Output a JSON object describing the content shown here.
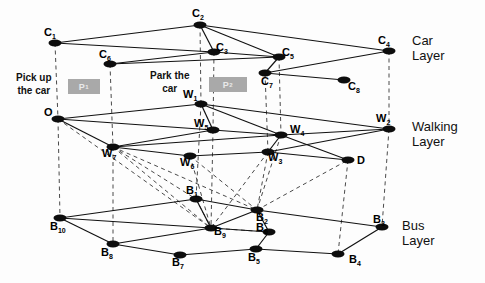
{
  "layers": [
    {
      "id": "car",
      "label_line1": "Car",
      "label_line2": "Layer",
      "x": 412,
      "y": 34
    },
    {
      "id": "walking",
      "label_line1": "Walking",
      "label_line2": "Layer",
      "x": 412,
      "y": 120
    },
    {
      "id": "bus",
      "label_line1": "Bus",
      "label_line2": "Layer",
      "x": 402,
      "y": 219
    }
  ],
  "actions": [
    {
      "id": "pickup",
      "line1": "Pick up",
      "line2": "the car",
      "x": 16,
      "y": 72,
      "box_label": "P",
      "box_sub": "1",
      "box_x": 68,
      "box_y": 79,
      "box_w": 32,
      "box_h": 15
    },
    {
      "id": "park",
      "line1": "Park the",
      "line2": "car",
      "x": 150,
      "y": 70,
      "box_label": "P",
      "box_sub": "2",
      "box_x": 209,
      "box_y": 77,
      "box_w": 38,
      "box_h": 15
    }
  ],
  "nodes": [
    {
      "id": "C1",
      "label": "C",
      "sub": "1",
      "x": 55,
      "y": 43,
      "lx": 44,
      "ly": 27
    },
    {
      "id": "C2",
      "label": "C",
      "sub": "2",
      "x": 200,
      "y": 25,
      "lx": 192,
      "ly": 8
    },
    {
      "id": "C3",
      "label": "C",
      "sub": "3",
      "x": 214,
      "y": 52,
      "lx": 216,
      "ly": 42
    },
    {
      "id": "C4",
      "label": "C",
      "sub": "4",
      "x": 389,
      "y": 51,
      "lx": 378,
      "ly": 35
    },
    {
      "id": "C5",
      "label": "C",
      "sub": "5",
      "x": 279,
      "y": 57,
      "lx": 282,
      "ly": 47
    },
    {
      "id": "C6",
      "label": "C",
      "sub": "6",
      "x": 110,
      "y": 64,
      "lx": 99,
      "ly": 49
    },
    {
      "id": "C7",
      "label": "C",
      "sub": "7",
      "x": 265,
      "y": 73,
      "lx": 261,
      "ly": 76
    },
    {
      "id": "C8",
      "label": "C",
      "sub": "8",
      "x": 344,
      "y": 80,
      "lx": 348,
      "ly": 81
    },
    {
      "id": "O",
      "label": "O",
      "sub": "",
      "x": 58,
      "y": 119,
      "lx": 44,
      "ly": 107
    },
    {
      "id": "W1",
      "label": "W",
      "sub": "1",
      "x": 201,
      "y": 104,
      "lx": 183,
      "ly": 89
    },
    {
      "id": "W2",
      "label": "W",
      "sub": "2",
      "x": 389,
      "y": 129,
      "lx": 376,
      "ly": 113
    },
    {
      "id": "W3",
      "label": "W",
      "sub": "3",
      "x": 268,
      "y": 152,
      "lx": 268,
      "ly": 152
    },
    {
      "id": "W4",
      "label": "W",
      "sub": "4",
      "x": 281,
      "y": 135,
      "lx": 290,
      "ly": 124
    },
    {
      "id": "W5",
      "label": "W",
      "sub": "5",
      "x": 213,
      "y": 130,
      "lx": 194,
      "ly": 118
    },
    {
      "id": "W6",
      "label": "W",
      "sub": "6",
      "x": 190,
      "y": 156,
      "lx": 180,
      "ly": 157
    },
    {
      "id": "W7",
      "label": "W",
      "sub": "7",
      "x": 113,
      "y": 147,
      "lx": 102,
      "ly": 148
    },
    {
      "id": "D",
      "label": "D",
      "sub": "",
      "x": 348,
      "y": 160,
      "lx": 357,
      "ly": 155
    },
    {
      "id": "B1",
      "label": "B",
      "sub": "1",
      "x": 196,
      "y": 199,
      "lx": 186,
      "ly": 185
    },
    {
      "id": "B2",
      "label": "B",
      "sub": "2",
      "x": 257,
      "y": 210,
      "lx": 256,
      "ly": 212
    },
    {
      "id": "B3",
      "label": "B",
      "sub": "3",
      "x": 382,
      "y": 227,
      "lx": 373,
      "ly": 214
    },
    {
      "id": "B4",
      "label": "B",
      "sub": "4",
      "x": 338,
      "y": 254,
      "lx": 349,
      "ly": 254
    },
    {
      "id": "B5",
      "label": "B",
      "sub": "5",
      "x": 256,
      "y": 249,
      "lx": 248,
      "ly": 252
    },
    {
      "id": "B6",
      "label": "B",
      "sub": "6",
      "x": 269,
      "y": 232,
      "lx": 256,
      "ly": 222
    },
    {
      "id": "B7",
      "label": "B",
      "sub": "7",
      "x": 180,
      "y": 255,
      "lx": 172,
      "ly": 257
    },
    {
      "id": "B8",
      "label": "B",
      "sub": "8",
      "x": 113,
      "y": 244,
      "lx": 101,
      "ly": 247
    },
    {
      "id": "B9",
      "label": "B",
      "sub": "9",
      "x": 211,
      "y": 228,
      "lx": 214,
      "ly": 226
    },
    {
      "id": "B10",
      "label": "B",
      "sub": "10",
      "x": 60,
      "y": 218,
      "lx": 50,
      "ly": 221
    }
  ],
  "solid_edges": [
    [
      "C1",
      "C2"
    ],
    [
      "C1",
      "C3"
    ],
    [
      "C2",
      "C3"
    ],
    [
      "C2",
      "C4"
    ],
    [
      "C2",
      "C5"
    ],
    [
      "C3",
      "C5"
    ],
    [
      "C6",
      "C3"
    ],
    [
      "C6",
      "C5"
    ],
    [
      "C5",
      "C7"
    ],
    [
      "C7",
      "C4"
    ],
    [
      "C7",
      "C8"
    ],
    [
      "O",
      "W1"
    ],
    [
      "O",
      "W5"
    ],
    [
      "O",
      "W7"
    ],
    [
      "W1",
      "W5"
    ],
    [
      "W1",
      "W4"
    ],
    [
      "W1",
      "W2"
    ],
    [
      "W5",
      "W4"
    ],
    [
      "W7",
      "W5"
    ],
    [
      "W7",
      "W6"
    ],
    [
      "W7",
      "W4"
    ],
    [
      "W6",
      "W3"
    ],
    [
      "W3",
      "W4"
    ],
    [
      "W4",
      "W2"
    ],
    [
      "W3",
      "W2"
    ],
    [
      "W3",
      "D"
    ],
    [
      "W4",
      "D"
    ],
    [
      "B10",
      "B1"
    ],
    [
      "B10",
      "B9"
    ],
    [
      "B10",
      "B8"
    ],
    [
      "B1",
      "B2"
    ],
    [
      "B2",
      "B3"
    ],
    [
      "B9",
      "B8"
    ],
    [
      "B9",
      "B6"
    ],
    [
      "B8",
      "B7"
    ],
    [
      "B7",
      "B5"
    ],
    [
      "B5",
      "B4"
    ],
    [
      "B4",
      "B3"
    ],
    [
      "B6",
      "B5"
    ],
    [
      "B2",
      "B6"
    ],
    [
      "B9",
      "B2"
    ],
    [
      "B9",
      "B1"
    ]
  ],
  "dashed_edges": [
    [
      "C1",
      "O"
    ],
    [
      "C2",
      "W1"
    ],
    [
      "C3",
      "W5"
    ],
    [
      "C5",
      "W4"
    ],
    [
      "C4",
      "W2"
    ],
    [
      "C7",
      "W3"
    ],
    [
      "C6",
      "W7"
    ],
    [
      "O",
      "B10"
    ],
    [
      "W7",
      "B8"
    ],
    [
      "W5",
      "B9"
    ],
    [
      "W4",
      "B2"
    ],
    [
      "W3",
      "B2"
    ],
    [
      "W2",
      "B3"
    ],
    [
      "W6",
      "B9"
    ],
    [
      "W1",
      "B1"
    ],
    [
      "D",
      "B4"
    ],
    [
      "O",
      "B9"
    ],
    [
      "W7",
      "B9"
    ],
    [
      "W7",
      "B1"
    ],
    [
      "W7",
      "B2"
    ],
    [
      "B1",
      "B9"
    ],
    [
      "W6",
      "B2"
    ],
    [
      "W3",
      "B9"
    ],
    [
      "B2",
      "D"
    ],
    [
      "B9",
      "B6"
    ]
  ]
}
